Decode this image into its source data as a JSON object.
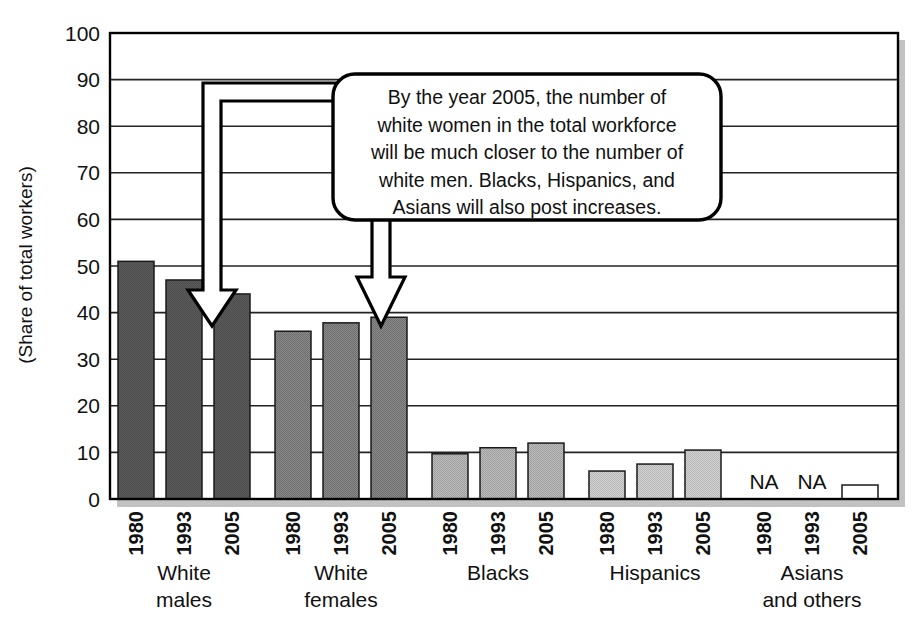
{
  "chart_data": {
    "type": "bar",
    "title": "",
    "subtitle": "",
    "xlabel": "",
    "ylabel": "(Share of total workers)",
    "ylim": [
      0,
      100
    ],
    "ytick_values": [
      0,
      10,
      20,
      30,
      40,
      50,
      60,
      70,
      80,
      90,
      100
    ],
    "ytick_labels": [
      "0",
      "10",
      "20",
      "30",
      "40",
      "50",
      "60",
      "70",
      "80",
      "90",
      "100"
    ],
    "grid": true,
    "legend_position": "none",
    "x_tick_labels": [
      "1980",
      "1993",
      "2005"
    ],
    "groups": [
      {
        "label_line1": "White",
        "label_line2": "males",
        "fill": "#565656",
        "bars": [
          {
            "year": "1980",
            "value": 51.0,
            "na": false
          },
          {
            "year": "1993",
            "value": 47.0,
            "na": false
          },
          {
            "year": "2005",
            "value": 44.0,
            "na": false
          }
        ]
      },
      {
        "label_line1": "White",
        "label_line2": "females",
        "fill": "#7b7b7b",
        "bars": [
          {
            "year": "1980",
            "value": 36.0,
            "na": false
          },
          {
            "year": "1993",
            "value": 37.8,
            "na": false
          },
          {
            "year": "2005",
            "value": 39.0,
            "na": false
          }
        ]
      },
      {
        "label_line1": "Blacks",
        "label_line2": "",
        "fill": "#adadad",
        "bars": [
          {
            "year": "1980",
            "value": 9.7,
            "na": false
          },
          {
            "year": "1993",
            "value": 11.0,
            "na": false
          },
          {
            "year": "2005",
            "value": 12.0,
            "na": false
          }
        ]
      },
      {
        "label_line1": "Hispanics",
        "label_line2": "",
        "fill": "#c6c6c6",
        "bars": [
          {
            "year": "1980",
            "value": 6.0,
            "na": false
          },
          {
            "year": "1993",
            "value": 7.5,
            "na": false
          },
          {
            "year": "2005",
            "value": 10.5,
            "na": false
          }
        ]
      },
      {
        "label_line1": "Asians",
        "label_line2": "and others",
        "fill": "#ffffff",
        "bars": [
          {
            "year": "1980",
            "value": 0,
            "na": true,
            "na_text": "NA"
          },
          {
            "year": "1993",
            "value": 0,
            "na": true,
            "na_text": "NA"
          },
          {
            "year": "2005",
            "value": 3.0,
            "na": false
          }
        ]
      }
    ],
    "annotations": [
      {
        "name": "callout-box",
        "text_lines": [
          "By the year 2005, the number of",
          "white women in the total workforce",
          "will be much closer to the number of",
          "white men. Blacks, Hispanics, and",
          "Asians will also post increases."
        ],
        "points_to": [
          "White males 2005",
          "White females 2005"
        ]
      }
    ],
    "colors": {
      "frame": "#000000",
      "gridline": "#222222",
      "shadow": "#bfbfbf",
      "background": "#ffffff",
      "callout_border": "#000000",
      "callout_fill": "#ffffff",
      "arrow_fill": "#ffffff",
      "arrow_stroke": "#000000"
    }
  }
}
